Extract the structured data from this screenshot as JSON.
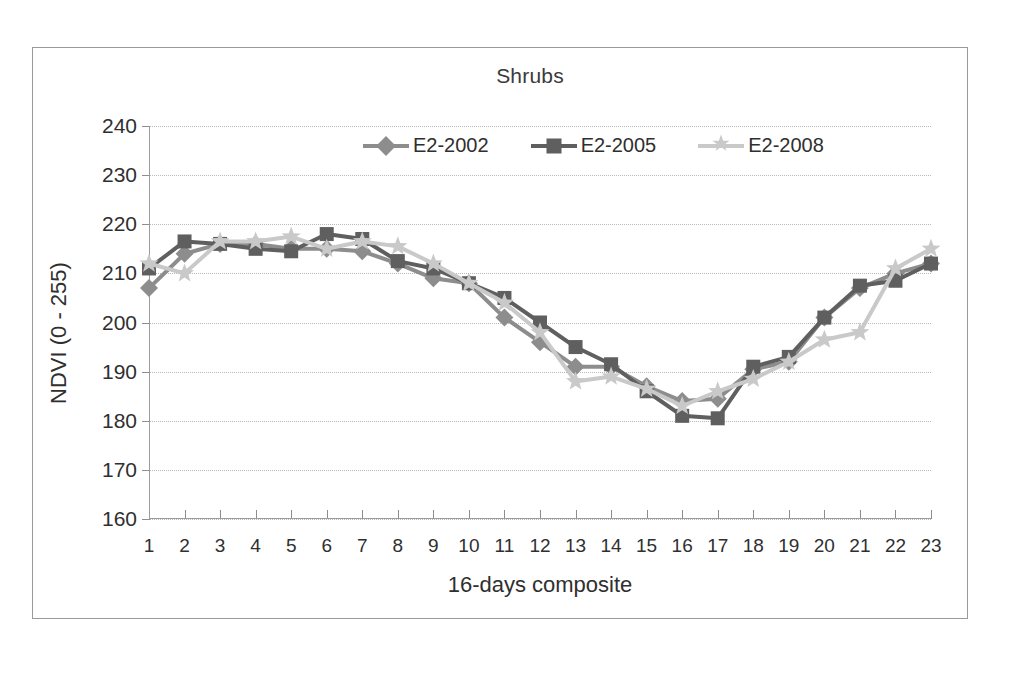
{
  "chart_data": {
    "type": "line",
    "title": "Shrubs",
    "xlabel": "16-days composite",
    "ylabel": "NDVI (0 - 255)",
    "xlim": [
      1,
      23
    ],
    "ylim": [
      160,
      240
    ],
    "yticks": [
      160,
      170,
      180,
      190,
      200,
      210,
      220,
      230,
      240
    ],
    "grid": true,
    "legend_position": "top-center-inside",
    "categories": [
      1,
      2,
      3,
      4,
      5,
      6,
      7,
      8,
      9,
      10,
      11,
      12,
      13,
      14,
      15,
      16,
      17,
      18,
      19,
      20,
      21,
      22,
      23
    ],
    "series": [
      {
        "name": "E2-2002",
        "marker": "diamond",
        "color": "#8d8d8d",
        "values": [
          207,
          214,
          216,
          216,
          215,
          215,
          214.5,
          212,
          209,
          208,
          201,
          196,
          191,
          191,
          187,
          184,
          184.5,
          190.5,
          192,
          201,
          207,
          210,
          212
        ]
      },
      {
        "name": "E2-2005",
        "marker": "square",
        "color": "#5f5f5f",
        "values": [
          211,
          216.5,
          216,
          215,
          214.5,
          218,
          217,
          212.5,
          211,
          208,
          205,
          200,
          195,
          191.5,
          186,
          181,
          180.5,
          191,
          193,
          201,
          207.5,
          208.5,
          212
        ]
      },
      {
        "name": "E2-2008",
        "marker": "star",
        "color": "#c9c9c9",
        "values": [
          212,
          210,
          216.5,
          216.5,
          217.5,
          215,
          216.5,
          215.5,
          212,
          208,
          204,
          198,
          188,
          189,
          186.5,
          183,
          186,
          188.5,
          192,
          196.5,
          198,
          211,
          215
        ]
      }
    ]
  },
  "legend": {
    "entries": [
      {
        "label": "E2-2002"
      },
      {
        "label": "E2-2005"
      },
      {
        "label": "E2-2008"
      }
    ]
  }
}
